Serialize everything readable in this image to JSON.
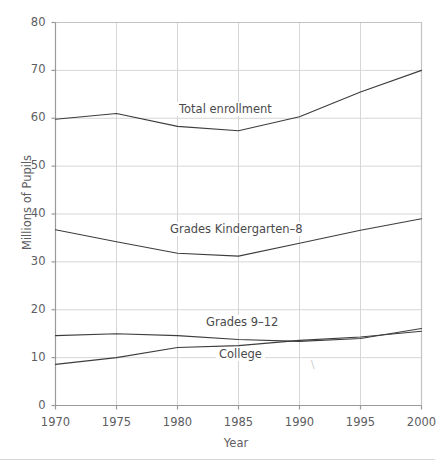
{
  "chart_data": {
    "type": "line",
    "title": "",
    "xlabel": "Year",
    "ylabel": "Millions of Pupils",
    "x": [
      1970,
      1975,
      1980,
      1985,
      1990,
      1995,
      2000
    ],
    "xtick_labels": [
      "1970",
      "1975",
      "1980",
      "1985",
      "1990",
      "1995",
      "2000"
    ],
    "ytick_labels": [
      "0",
      "10",
      "20",
      "30",
      "40",
      "50",
      "60",
      "70",
      "80"
    ],
    "yticks": [
      0,
      10,
      20,
      30,
      40,
      50,
      60,
      70,
      80
    ],
    "xlim": [
      1970,
      2000
    ],
    "ylim": [
      0,
      80
    ],
    "grid": true,
    "legend": "inline-labels",
    "line_color": "#3d3d3f",
    "grid_color": "#d6d6d8",
    "axis_color": "#c3c3c5",
    "series": [
      {
        "name": "Total enrollment",
        "label": "Total enrollment",
        "values": [
          59.8,
          61.0,
          58.3,
          57.4,
          60.3,
          65.5,
          70.0
        ]
      },
      {
        "name": "Grades Kindergarten-8",
        "label": "Grades Kindergarten–8",
        "values": [
          36.7,
          34.2,
          31.8,
          31.2,
          33.9,
          36.6,
          39.0
        ]
      },
      {
        "name": "Grades 9-12",
        "label": "Grades 9–12",
        "values": [
          14.6,
          15.0,
          14.6,
          13.8,
          13.4,
          14.0,
          16.1
        ]
      },
      {
        "name": "College",
        "label": "College",
        "values": [
          8.6,
          10.0,
          12.1,
          12.5,
          13.6,
          14.3,
          15.5
        ]
      }
    ]
  },
  "axis": {
    "y_title": "Millions of Pupils",
    "x_title": "Year"
  },
  "artifacts": {
    "title_remnant": "",
    "stray_mark": "\\"
  }
}
